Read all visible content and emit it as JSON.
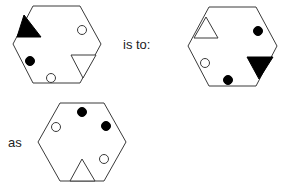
{
  "puzzle": {
    "text_is_to": "is to:",
    "text_as": "as",
    "colors": {
      "stroke": "#3a3a3a",
      "fill_black": "#000000",
      "fill_white": "#ffffff"
    }
  },
  "hexagons": [
    {
      "name": "hexagon-1",
      "points": "33,6 80,6 101,44 80,83 33,83 13,44",
      "shapes": [
        {
          "type": "triangle",
          "fill": "black",
          "points": "24,15 41,37 17,37"
        },
        {
          "type": "triangle",
          "fill": "white",
          "points": "71,55 96,55 83,78"
        },
        {
          "type": "circle",
          "fill": "white",
          "cx": 82,
          "cy": 30,
          "r": 4.5
        },
        {
          "type": "circle",
          "fill": "black",
          "cx": 30,
          "cy": 61,
          "r": 4.5
        },
        {
          "type": "circle",
          "fill": "white",
          "cx": 51,
          "cy": 78,
          "r": 4.5
        }
      ]
    },
    {
      "name": "hexagon-2",
      "points": "209,7 256,7 277,46 256,86 209,86 188,46",
      "shapes": [
        {
          "type": "triangle",
          "fill": "white",
          "points": "206,17 218,38 194,38"
        },
        {
          "type": "triangle",
          "fill": "black",
          "points": "247,57 273,57 259,79"
        },
        {
          "type": "circle",
          "fill": "black",
          "cx": 258,
          "cy": 31,
          "r": 4.5
        },
        {
          "type": "circle",
          "fill": "white",
          "cx": 205,
          "cy": 63,
          "r": 4.5
        },
        {
          "type": "circle",
          "fill": "black",
          "cx": 228,
          "cy": 80,
          "r": 4.5
        }
      ]
    },
    {
      "name": "hexagon-3",
      "points": "60,103 104,103 126,142 104,181 60,181 38,142",
      "shapes": [
        {
          "type": "triangle",
          "fill": "white",
          "points": "82,159 95,181 70,181"
        },
        {
          "type": "circle",
          "fill": "black",
          "cx": 82,
          "cy": 112,
          "r": 4.5
        },
        {
          "type": "circle",
          "fill": "white",
          "cx": 56,
          "cy": 127,
          "r": 4.5
        },
        {
          "type": "circle",
          "fill": "black",
          "cx": 106,
          "cy": 126,
          "r": 4.5
        },
        {
          "type": "circle",
          "fill": "white",
          "cx": 104,
          "cy": 159,
          "r": 4.5
        }
      ]
    }
  ]
}
